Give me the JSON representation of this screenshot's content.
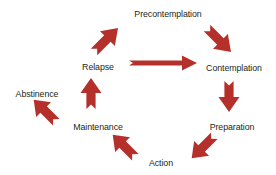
{
  "diagram": {
    "type": "cycle-diagram",
    "background_color": "#ffffff",
    "arrow_color": "#b5302a",
    "arrow_color_dark": "#8f2420",
    "text_color": "#231f20",
    "nodes": [
      {
        "id": "precontemplation",
        "label": "Precontemplation",
        "x": 168,
        "y": 13
      },
      {
        "id": "contemplation",
        "label": "Contemplation",
        "x": 232,
        "y": 67
      },
      {
        "id": "preparation",
        "label": "Preparation",
        "x": 231,
        "y": 126
      },
      {
        "id": "action",
        "label": "Action",
        "x": 161,
        "y": 162
      },
      {
        "id": "maintenance",
        "label": "Maintenance",
        "x": 98,
        "y": 126
      },
      {
        "id": "abstinence",
        "label": "Abstinence",
        "x": 37,
        "y": 93
      },
      {
        "id": "relapse",
        "label": "Relapse",
        "x": 98,
        "y": 66
      }
    ],
    "arrows": [
      {
        "id": "relapse-to-precontemplation",
        "from": "relapse",
        "to": "precontemplation",
        "direction": "up-right"
      },
      {
        "id": "precontemplation-to-contemplation",
        "from": "precontemplation",
        "to": "contemplation",
        "direction": "down-right"
      },
      {
        "id": "contemplation-to-preparation",
        "from": "contemplation",
        "to": "preparation",
        "direction": "down"
      },
      {
        "id": "preparation-to-action",
        "from": "preparation",
        "to": "action",
        "direction": "down-left"
      },
      {
        "id": "action-to-maintenance",
        "from": "action",
        "to": "maintenance",
        "direction": "up-left"
      },
      {
        "id": "maintenance-to-abstinence",
        "from": "maintenance",
        "to": "abstinence",
        "direction": "up-left"
      },
      {
        "id": "maintenance-to-relapse",
        "from": "maintenance",
        "to": "relapse",
        "direction": "up"
      },
      {
        "id": "relapse-to-contemplation",
        "from": "relapse",
        "to": "contemplation",
        "direction": "right"
      }
    ]
  }
}
